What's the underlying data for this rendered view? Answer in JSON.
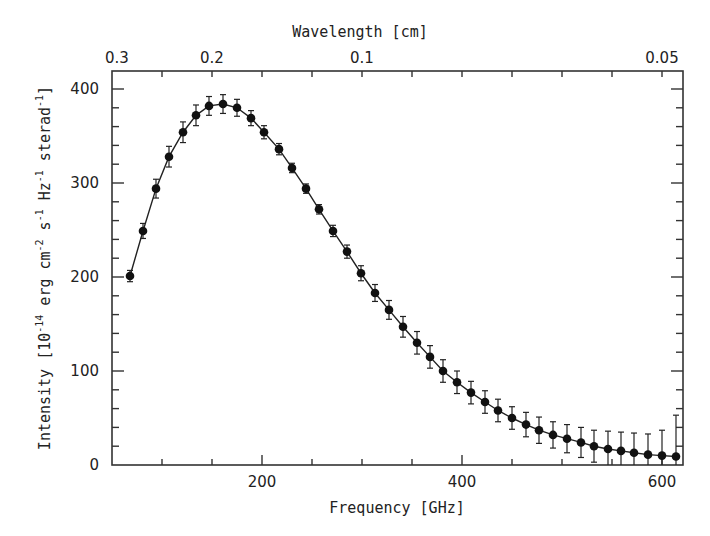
{
  "chart_data": {
    "type": "scatter",
    "title": "",
    "xlabel": "Frequency [GHz]",
    "ylabel": "Intensity [10^-14 erg cm^-2 s^-1 Hz^-1 sterad^-1]",
    "top_xlabel": "Wavelength [cm]",
    "xlim": [
      50,
      621
    ],
    "ylim": [
      0,
      419
    ],
    "grid": false,
    "legend": null,
    "x_ticks": [
      200,
      400,
      600
    ],
    "x_minor_step": 50,
    "y_ticks": [
      0,
      100,
      200,
      300,
      400
    ],
    "y_minor_step": 20,
    "top_ticks": [
      {
        "label": "0.3",
        "freq": 55
      },
      {
        "label": "0.2",
        "freq": 150
      },
      {
        "label": "0.1",
        "freq": 300
      },
      {
        "label": "0.05",
        "freq": 600
      }
    ],
    "series": [
      {
        "name": "Measured spectrum",
        "style": "points with error bars joined by line",
        "x": [
          68,
          81,
          94,
          107,
          121,
          134,
          147,
          161,
          175,
          189,
          202,
          217,
          230,
          244,
          257,
          271,
          285,
          299,
          313,
          327,
          341,
          355,
          368,
          381,
          395,
          409,
          423,
          436,
          450,
          464,
          477,
          491,
          505,
          519,
          532,
          546,
          559,
          572,
          586,
          600,
          614
        ],
        "y": [
          201,
          249,
          294,
          328,
          354,
          372,
          382,
          384,
          380,
          369,
          354,
          336,
          316,
          294,
          272,
          249,
          227,
          204,
          183,
          165,
          147,
          130,
          115,
          100,
          88,
          77,
          67,
          58,
          50,
          43,
          37,
          32,
          28,
          24,
          20,
          17,
          15,
          13,
          11,
          10,
          9
        ],
        "yerr": [
          6,
          8,
          10,
          11,
          11,
          11,
          10,
          10,
          9,
          8,
          7,
          6,
          5,
          5,
          5,
          6,
          7,
          8,
          9,
          10,
          11,
          12,
          12,
          12,
          12,
          12,
          12,
          12,
          12,
          13,
          14,
          14,
          15,
          16,
          17,
          19,
          20,
          21,
          22,
          27,
          44
        ]
      }
    ]
  },
  "labels": {
    "x_title": "Frequency [GHz]",
    "top_title": "Wavelength [cm]",
    "y_title_parts": [
      {
        "t": "Intensity [10",
        "sup": "-14"
      },
      {
        "t": " erg cm",
        "sup": "-2"
      },
      {
        "t": " s",
        "sup": "-1"
      },
      {
        "t": " Hz",
        "sup": "-1"
      },
      {
        "t": " sterad",
        "sup": "-1"
      },
      {
        "t": "]",
        "sup": ""
      }
    ]
  }
}
